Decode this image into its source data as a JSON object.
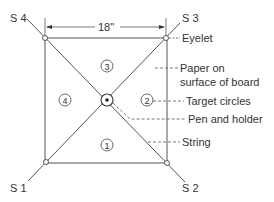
{
  "diagram": {
    "corners": [
      {
        "id": "S4",
        "label": "S 4",
        "x": 45,
        "y": 38,
        "lx": 8,
        "ly": 17
      },
      {
        "id": "S3",
        "label": "S 3",
        "x": 166,
        "y": 38,
        "lx": 182,
        "ly": 17
      },
      {
        "id": "S2",
        "label": "S 2",
        "x": 167,
        "y": 163,
        "lx": 182,
        "ly": 191
      },
      {
        "id": "S1",
        "label": "S 1",
        "x": 46,
        "y": 162,
        "lx": 10,
        "ly": 191
      }
    ],
    "dimension": {
      "label": "18\""
    },
    "regions": [
      "1",
      "2",
      "3",
      "4"
    ],
    "callouts": {
      "eyelet": "Eyelet",
      "paper_line1": "Paper on",
      "paper_line2": "surface of board",
      "target": "Target circles",
      "pen": "Pen and holder",
      "string": "String"
    },
    "colors": {
      "line": "#555555",
      "text": "#333333",
      "background": "#ffffff"
    }
  }
}
